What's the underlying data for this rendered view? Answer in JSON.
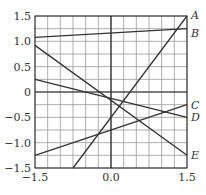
{
  "chart_data": {
    "type": "line",
    "title": "",
    "xlabel": "",
    "ylabel": "",
    "xlim": [
      -1.5,
      1.5
    ],
    "ylim": [
      -1.5,
      1.5
    ],
    "grid": true,
    "grid_step": 0.25,
    "x_ticks": [
      "-1.5",
      "0.0",
      "1.5"
    ],
    "y_ticks": [
      "1.5",
      "1.0",
      "0.5",
      "0",
      "-0.5",
      "-1.0",
      "-1.5"
    ],
    "series": [
      {
        "name": "A",
        "x": [
          -0.75,
          1.5
        ],
        "y": [
          -1.5,
          1.5
        ]
      },
      {
        "name": "B",
        "x": [
          -1.5,
          1.5
        ],
        "y": [
          1.08,
          1.25
        ]
      },
      {
        "name": "C",
        "x": [
          -1.5,
          1.5
        ],
        "y": [
          -1.25,
          -0.25
        ]
      },
      {
        "name": "D",
        "x": [
          -1.5,
          1.5
        ],
        "y": [
          0.25,
          -0.5
        ]
      },
      {
        "name": "E",
        "x": [
          -1.5,
          1.5
        ],
        "y": [
          0.92,
          -1.25
        ]
      }
    ],
    "legend": "inline labels at right end of lines"
  },
  "colors": {
    "line": "#333333",
    "grid": "#999999",
    "axis": "#222222"
  }
}
